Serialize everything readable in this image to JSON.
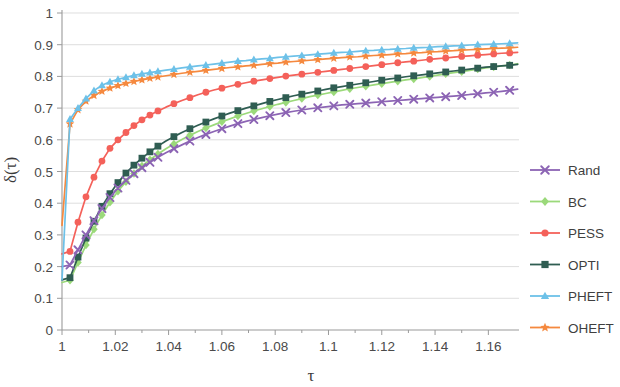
{
  "chart_data": {
    "type": "line",
    "title": "",
    "xlabel": "τ",
    "ylabel": "δ(τ)",
    "xlim": [
      1.0,
      1.1715
    ],
    "ylim": [
      0,
      1
    ],
    "grid": true,
    "legend_position": "right",
    "x_ticks": [
      "1",
      "1.02",
      "1.04",
      "1.06",
      "1.08",
      "1.1",
      "1.12",
      "1.14",
      "1.16"
    ],
    "x_tick_values": [
      1.0,
      1.02,
      1.04,
      1.06,
      1.08,
      1.1,
      1.12,
      1.14,
      1.16
    ],
    "y_ticks": [
      "0",
      "0.1",
      "0.2",
      "0.3",
      "0.4",
      "0.5",
      "0.6",
      "0.7",
      "0.8",
      "0.9",
      "1"
    ],
    "y_tick_values": [
      0,
      0.1,
      0.2,
      0.3,
      0.4,
      0.5,
      0.6,
      0.7,
      0.8,
      0.9,
      1.0
    ],
    "x": [
      1.0,
      1.003,
      1.006,
      1.009,
      1.012,
      1.015,
      1.018,
      1.021,
      1.024,
      1.027,
      1.03,
      1.033,
      1.036,
      1.039,
      1.042,
      1.045,
      1.048,
      1.051,
      1.054,
      1.057,
      1.06,
      1.063,
      1.066,
      1.069,
      1.072,
      1.075,
      1.078,
      1.081,
      1.084,
      1.087,
      1.09,
      1.093,
      1.096,
      1.099,
      1.102,
      1.105,
      1.108,
      1.111,
      1.114,
      1.117,
      1.12,
      1.123,
      1.126,
      1.129,
      1.132,
      1.135,
      1.138,
      1.141,
      1.144,
      1.147,
      1.15,
      1.153,
      1.156,
      1.159,
      1.162,
      1.165,
      1.168,
      1.171
    ],
    "series": [
      {
        "name": "Rand",
        "color": "#8c64b4",
        "marker": "x",
        "values": [
          0.2,
          0.205,
          0.253,
          0.3,
          0.345,
          0.383,
          0.418,
          0.448,
          0.472,
          0.493,
          0.512,
          0.529,
          0.545,
          0.559,
          0.572,
          0.584,
          0.596,
          0.607,
          0.617,
          0.626,
          0.635,
          0.643,
          0.651,
          0.658,
          0.664,
          0.67,
          0.676,
          0.681,
          0.686,
          0.69,
          0.694,
          0.698,
          0.701,
          0.704,
          0.707,
          0.71,
          0.712,
          0.714,
          0.716,
          0.718,
          0.72,
          0.722,
          0.724,
          0.726,
          0.728,
          0.73,
          0.732,
          0.734,
          0.736,
          0.738,
          0.74,
          0.743,
          0.745,
          0.748,
          0.75,
          0.753,
          0.756,
          0.76
        ]
      },
      {
        "name": "BC",
        "color": "#9bd97a",
        "marker": "diamond",
        "values": [
          0.15,
          0.157,
          0.213,
          0.268,
          0.318,
          0.363,
          0.403,
          0.438,
          0.468,
          0.494,
          0.517,
          0.537,
          0.555,
          0.572,
          0.587,
          0.601,
          0.614,
          0.626,
          0.637,
          0.647,
          0.657,
          0.666,
          0.675,
          0.683,
          0.691,
          0.698,
          0.705,
          0.712,
          0.718,
          0.724,
          0.73,
          0.736,
          0.741,
          0.746,
          0.751,
          0.756,
          0.761,
          0.765,
          0.769,
          0.773,
          0.777,
          0.781,
          0.785,
          0.789,
          0.792,
          0.796,
          0.8,
          0.804,
          0.808,
          0.812,
          0.815,
          0.819,
          0.823,
          0.827,
          0.83,
          0.833,
          0.836,
          0.84
        ]
      },
      {
        "name": "PESS",
        "color": "#f4615a",
        "marker": "circle",
        "values": [
          0.24,
          0.248,
          0.34,
          0.42,
          0.482,
          0.533,
          0.573,
          0.6,
          0.623,
          0.645,
          0.663,
          0.678,
          0.691,
          0.703,
          0.714,
          0.724,
          0.733,
          0.742,
          0.75,
          0.757,
          0.763,
          0.769,
          0.775,
          0.78,
          0.785,
          0.789,
          0.793,
          0.797,
          0.801,
          0.804,
          0.807,
          0.81,
          0.813,
          0.816,
          0.819,
          0.822,
          0.825,
          0.828,
          0.831,
          0.834,
          0.837,
          0.84,
          0.843,
          0.846,
          0.848,
          0.851,
          0.854,
          0.856,
          0.858,
          0.861,
          0.863,
          0.865,
          0.867,
          0.869,
          0.871,
          0.873,
          0.874,
          0.876
        ]
      },
      {
        "name": "OPTI",
        "color": "#2f5d52",
        "marker": "square",
        "values": [
          0.158,
          0.165,
          0.23,
          0.29,
          0.343,
          0.39,
          0.43,
          0.465,
          0.495,
          0.52,
          0.542,
          0.562,
          0.58,
          0.596,
          0.61,
          0.623,
          0.635,
          0.646,
          0.656,
          0.666,
          0.675,
          0.684,
          0.692,
          0.7,
          0.707,
          0.714,
          0.721,
          0.727,
          0.733,
          0.739,
          0.744,
          0.749,
          0.754,
          0.759,
          0.764,
          0.768,
          0.772,
          0.776,
          0.78,
          0.784,
          0.788,
          0.792,
          0.795,
          0.799,
          0.802,
          0.805,
          0.808,
          0.811,
          0.814,
          0.817,
          0.82,
          0.823,
          0.826,
          0.829,
          0.831,
          0.833,
          0.835,
          0.838
        ]
      },
      {
        "name": "PHEFT",
        "color": "#6dc1e8",
        "marker": "triangle",
        "values": [
          0.158,
          0.665,
          0.7,
          0.73,
          0.755,
          0.772,
          0.783,
          0.791,
          0.797,
          0.803,
          0.808,
          0.812,
          0.816,
          0.82,
          0.823,
          0.827,
          0.83,
          0.833,
          0.836,
          0.839,
          0.842,
          0.845,
          0.848,
          0.85,
          0.853,
          0.855,
          0.857,
          0.86,
          0.862,
          0.864,
          0.866,
          0.868,
          0.87,
          0.872,
          0.874,
          0.876,
          0.877,
          0.879,
          0.881,
          0.882,
          0.884,
          0.885,
          0.887,
          0.888,
          0.89,
          0.891,
          0.892,
          0.894,
          0.895,
          0.896,
          0.897,
          0.899,
          0.9,
          0.901,
          0.902,
          0.903,
          0.904,
          0.906
        ]
      },
      {
        "name": "OHEFT",
        "color": "#f5893f",
        "marker": "star",
        "values": [
          0.33,
          0.65,
          0.695,
          0.722,
          0.74,
          0.753,
          0.763,
          0.771,
          0.778,
          0.784,
          0.789,
          0.794,
          0.798,
          0.802,
          0.806,
          0.81,
          0.813,
          0.816,
          0.819,
          0.822,
          0.825,
          0.828,
          0.83,
          0.833,
          0.835,
          0.838,
          0.84,
          0.842,
          0.845,
          0.847,
          0.849,
          0.851,
          0.853,
          0.855,
          0.857,
          0.859,
          0.861,
          0.862,
          0.864,
          0.866,
          0.867,
          0.869,
          0.871,
          0.872,
          0.874,
          0.875,
          0.877,
          0.878,
          0.88,
          0.881,
          0.883,
          0.884,
          0.885,
          0.887,
          0.888,
          0.889,
          0.89,
          0.892
        ]
      }
    ]
  },
  "legend": {
    "items": [
      {
        "label": "Rand"
      },
      {
        "label": "BC"
      },
      {
        "label": "PESS"
      },
      {
        "label": "OPTI"
      },
      {
        "label": "PHEFT"
      },
      {
        "label": "OHEFT"
      }
    ]
  },
  "axes": {
    "x_title": "τ",
    "y_title": "δ(τ)"
  }
}
